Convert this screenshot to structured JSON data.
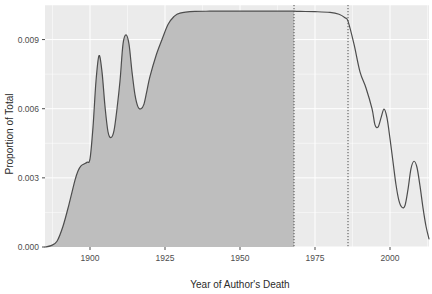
{
  "chart_data": {
    "type": "area",
    "title": "",
    "subtitle": "",
    "xlabel": "Year of Author's Death",
    "ylabel": "Proportion of Total",
    "xlim": [
      1885,
      2013
    ],
    "ylim": [
      0.0,
      0.0105
    ],
    "x_ticks": [
      1900,
      1925,
      1950,
      1975,
      2000
    ],
    "x_tick_labels": [
      "1900",
      "1925",
      "1950",
      "1975",
      "2000"
    ],
    "y_ticks": [
      0.0,
      0.003,
      0.006,
      0.009
    ],
    "y_tick_labels": [
      "0.000",
      "0.003",
      "0.006",
      "0.009"
    ],
    "grid": true,
    "legend": "none",
    "panel_background": "#EBEBEB",
    "grid_color": "#FFFFFF",
    "line_color": "#4D4D4D",
    "fill_color": "#BEBEBE",
    "annotations": [
      {
        "name": "vline-left",
        "type": "vertical-dotted-line",
        "x": 1968,
        "color": "#4D4D4D"
      },
      {
        "name": "vline-right",
        "type": "vertical-dotted-line",
        "x": 1986,
        "color": "#4D4D4D"
      }
    ],
    "shaded_region": {
      "name": "public-domain-shading",
      "x_start": 1885,
      "x_end": 1968,
      "fill": "#BEBEBE"
    },
    "series": [
      {
        "name": "density",
        "x": [
          1885,
          1887,
          1889,
          1891,
          1893,
          1895,
          1896,
          1897,
          1898,
          1899,
          1900,
          1901,
          1902,
          1903,
          1904,
          1905,
          1906,
          1907,
          1908,
          1909,
          1910,
          1911,
          1912,
          1913,
          1914,
          1915,
          1916,
          1917,
          1918,
          1919,
          1920,
          1922,
          1924,
          1926,
          1928,
          1930,
          1935,
          1940,
          1945,
          1950,
          1955,
          1960,
          1965,
          1968,
          1970,
          1975,
          1980,
          1983,
          1985,
          1986,
          1988,
          1990,
          1992,
          1994,
          1995,
          1996,
          1997,
          1998,
          1999,
          2000,
          2001,
          2002,
          2003,
          2004,
          2005,
          2006,
          2007,
          2008,
          2009,
          2010,
          2011,
          2012,
          2013
        ],
        "y": [
          0.0,
          6e-05,
          0.00025,
          0.0009,
          0.00185,
          0.0029,
          0.0033,
          0.00352,
          0.0036,
          0.00368,
          0.00382,
          0.0052,
          0.0072,
          0.0083,
          0.0076,
          0.0061,
          0.005,
          0.00475,
          0.00505,
          0.006,
          0.0072,
          0.0088,
          0.0092,
          0.0088,
          0.0076,
          0.0066,
          0.00608,
          0.006,
          0.0062,
          0.0068,
          0.0074,
          0.0083,
          0.009,
          0.00965,
          0.01,
          0.01015,
          0.01022,
          0.01023,
          0.01023,
          0.01023,
          0.01023,
          0.01023,
          0.01023,
          0.01023,
          0.01022,
          0.01021,
          0.01018,
          0.0101,
          0.00995,
          0.0098,
          0.0088,
          0.0076,
          0.0069,
          0.006,
          0.0053,
          0.0052,
          0.0056,
          0.00598,
          0.0056,
          0.0047,
          0.0037,
          0.0027,
          0.002,
          0.00172,
          0.0018,
          0.0025,
          0.0034,
          0.00372,
          0.00345,
          0.00265,
          0.0017,
          0.0009,
          0.00035
        ]
      }
    ]
  },
  "axis": {
    "x_title": "Year of Author's Death",
    "y_title": "Proportion of Total"
  }
}
